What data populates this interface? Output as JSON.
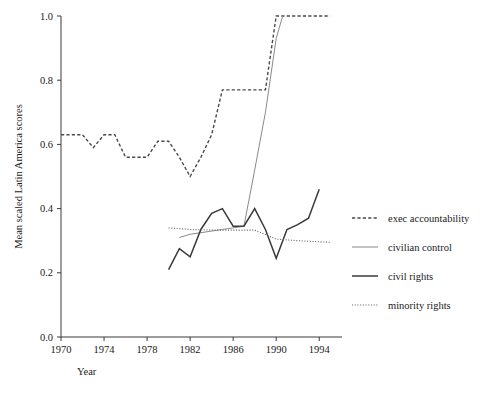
{
  "figure": {
    "title_sliver": "",
    "background": "#ffffff"
  },
  "axes": {
    "x_title": "Year",
    "y_title": "Mean scaled Latin America scores",
    "x_ticks": [
      "1970",
      "1974",
      "1978",
      "1982",
      "1986",
      "1990",
      "1994"
    ],
    "y_ticks": [
      "0.0",
      "0.2",
      "0.4",
      "0.6",
      "0.8",
      "1.0"
    ]
  },
  "legend": {
    "entries": [
      {
        "label": "exec accountability",
        "style": "dashed",
        "color": "#4a4a4a"
      },
      {
        "label": "civilian control",
        "style": "solid-thin",
        "color": "#8a8a8a"
      },
      {
        "label": "civil rights",
        "style": "solid-bold",
        "color": "#3a3a3a"
      },
      {
        "label": "minority rights",
        "style": "dotted",
        "color": "#6a6a6a"
      }
    ]
  },
  "chart_data": {
    "type": "line",
    "title": "",
    "xlabel": "Year",
    "ylabel": "Mean scaled Latin America scores",
    "xlim": [
      1970,
      1995
    ],
    "ylim": [
      0.0,
      1.0
    ],
    "xticks": [
      1970,
      1974,
      1978,
      1982,
      1986,
      1990,
      1994
    ],
    "yticks": [
      0.0,
      0.2,
      0.4,
      0.6,
      0.8,
      1.0
    ],
    "grid": false,
    "legend_position": "right",
    "series": [
      {
        "name": "exec accountability",
        "style": "dashed",
        "color": "#4a4a4a",
        "width": 1.4,
        "x": [
          1970,
          1971,
          1972,
          1973,
          1974,
          1975,
          1976,
          1977,
          1978,
          1979,
          1980,
          1981,
          1982,
          1983,
          1984,
          1985,
          1986,
          1987,
          1988,
          1989,
          1990,
          1991,
          1992,
          1993,
          1994,
          1995
        ],
        "y": [
          0.63,
          0.63,
          0.63,
          0.59,
          0.63,
          0.63,
          0.56,
          0.56,
          0.56,
          0.61,
          0.61,
          0.56,
          0.5,
          0.56,
          0.63,
          0.77,
          0.77,
          0.77,
          0.77,
          0.77,
          1.0,
          1.0,
          1.0,
          1.0,
          1.0,
          1.0
        ]
      },
      {
        "name": "civilian control",
        "style": "solid-thin",
        "color": "#8a8a8a",
        "width": 1.0,
        "x": [
          1981,
          1982,
          1983,
          1984,
          1985,
          1986,
          1987,
          1988,
          1989,
          1990,
          1990.6
        ],
        "y": [
          0.31,
          0.32,
          0.325,
          0.33,
          0.335,
          0.34,
          0.345,
          0.52,
          0.7,
          0.93,
          1.0
        ]
      },
      {
        "name": "civil rights",
        "style": "solid-bold",
        "color": "#3a3a3a",
        "width": 1.5,
        "x": [
          1980,
          1981,
          1982,
          1983,
          1984,
          1985,
          1986,
          1987,
          1988,
          1989,
          1990,
          1991,
          1992,
          1993,
          1994
        ],
        "y": [
          0.21,
          0.275,
          0.25,
          0.335,
          0.385,
          0.4,
          0.345,
          0.345,
          0.4,
          0.335,
          0.245,
          0.335,
          0.35,
          0.37,
          0.46
        ]
      },
      {
        "name": "minority rights",
        "style": "dotted",
        "color": "#6a6a6a",
        "width": 1.1,
        "x": [
          1980,
          1982,
          1984,
          1986,
          1988,
          1990,
          1992,
          1995
        ],
        "y": [
          0.34,
          0.335,
          0.333,
          0.333,
          0.333,
          0.305,
          0.3,
          0.295
        ]
      }
    ]
  }
}
